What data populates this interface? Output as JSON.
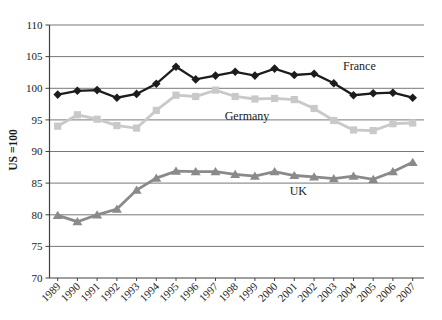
{
  "figure": {
    "background": "#ffffff",
    "text_color": "#1a1a1a",
    "gridline_color": "#787878",
    "axis_color": "#404040"
  },
  "chart_data": {
    "type": "line",
    "title": "",
    "xlabel": "",
    "ylabel": "US =100",
    "ylim": [
      70,
      110
    ],
    "ytick_step": 5,
    "grid": true,
    "legend_position": "inline-annotations",
    "x": [
      1989,
      1990,
      1991,
      1992,
      1993,
      1994,
      1995,
      1996,
      1997,
      1998,
      1999,
      2000,
      2001,
      2002,
      2003,
      2004,
      2005,
      2006,
      2007
    ],
    "series": [
      {
        "name": "France",
        "marker": "diamond",
        "color": "#1c1c1c",
        "values": [
          99.0,
          99.6,
          99.7,
          98.5,
          99.1,
          100.7,
          103.4,
          101.4,
          102.0,
          102.6,
          102.0,
          103.1,
          102.1,
          102.3,
          100.8,
          98.9,
          99.2,
          99.3,
          98.5
        ]
      },
      {
        "name": "Germany",
        "marker": "square",
        "color": "#c9c9c9",
        "values": [
          94.0,
          95.8,
          95.1,
          94.1,
          93.7,
          96.5,
          98.9,
          98.7,
          99.7,
          98.7,
          98.3,
          98.4,
          98.2,
          96.8,
          94.9,
          93.4,
          93.3,
          94.4,
          94.5
        ]
      },
      {
        "name": "UK",
        "marker": "triangle",
        "color": "#8a8a8a",
        "values": [
          79.9,
          78.9,
          80.0,
          80.9,
          83.9,
          85.8,
          86.9,
          86.8,
          86.8,
          86.4,
          86.1,
          86.8,
          86.2,
          86.0,
          85.7,
          86.1,
          85.6,
          86.8,
          88.3
        ]
      }
    ],
    "annotations": [
      {
        "text": "France",
        "x": 2004.3,
        "y": 103.6
      },
      {
        "text": "Germany",
        "x": 1998.6,
        "y": 95.6
      },
      {
        "text": "UK",
        "x": 2001.2,
        "y": 83.8
      }
    ]
  }
}
